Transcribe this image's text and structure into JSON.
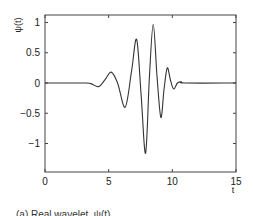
{
  "chart_data": {
    "type": "line",
    "title": "",
    "xlabel": "t",
    "ylabel": "ψ(t)",
    "xlim": [
      0,
      15
    ],
    "ylim": [
      -1.5,
      1.13
    ],
    "xticks": [
      0,
      5,
      10,
      15
    ],
    "xtick_labels": [
      "0",
      "5",
      "10",
      "15"
    ],
    "yticks": [
      1,
      0.5,
      0,
      -0.5,
      -1
    ],
    "ytick_labels": [
      "1",
      "0.5",
      "0",
      "−0.5",
      "−1"
    ],
    "grid": false,
    "legend": null,
    "series": [
      {
        "name": "ψ(t)",
        "color": "#333333",
        "x": [
          0,
          3.0,
          3.6,
          4.2,
          4.7,
          5.2,
          5.7,
          6.3,
          6.8,
          7.2,
          7.55,
          7.9,
          8.2,
          8.5,
          8.8,
          9.1,
          9.35,
          9.6,
          9.85,
          10.1,
          10.4,
          10.7,
          11.0,
          15
        ],
        "y": [
          0,
          0,
          -0.01,
          -0.06,
          0.05,
          0.18,
          0.0,
          -0.4,
          0.2,
          0.72,
          -0.2,
          -1.16,
          0.1,
          0.97,
          0.1,
          -0.57,
          -0.1,
          0.25,
          0.05,
          -0.1,
          0.0,
          0.02,
          0,
          0
        ]
      }
    ]
  },
  "caption": "(a) Real wavelet, ψ(t)"
}
